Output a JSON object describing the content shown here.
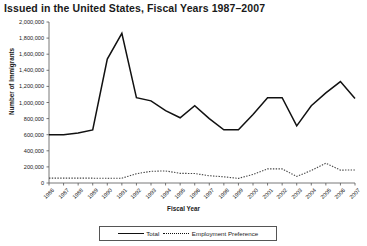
{
  "chart_data": {
    "type": "line",
    "title": "Issued in the United States, Fiscal Years 1987–2007",
    "xlabel": "Fiscal Year",
    "ylabel": "Number of Immigrants",
    "grid": false,
    "legend_position": "bottom",
    "ylim": [
      0,
      2000000
    ],
    "yticks": [
      0,
      200000,
      400000,
      600000,
      800000,
      1000000,
      1200000,
      1400000,
      1600000,
      1800000,
      2000000
    ],
    "ytick_labels": [
      "0",
      "200,000",
      "400,000",
      "600,000",
      "800,000",
      "1,000,000",
      "1,200,000",
      "1,400,000",
      "1,600,000",
      "1,800,000",
      "2,000,000"
    ],
    "categories": [
      "1986",
      "1987",
      "1988",
      "1989",
      "1990",
      "1991",
      "1992",
      "1993",
      "1994",
      "1995",
      "1996",
      "1997",
      "1998",
      "1999",
      "2000",
      "2001",
      "2002",
      "2003",
      "2004",
      "2005",
      "2006",
      "2007"
    ],
    "series": [
      {
        "name": "Total",
        "style": "solid",
        "color": "#111111",
        "values": [
          600000,
          600000,
          620000,
          660000,
          1540000,
          1860000,
          1060000,
          1020000,
          900000,
          810000,
          960000,
          800000,
          660000,
          660000,
          850000,
          1060000,
          1060000,
          710000,
          960000,
          1120000,
          1260000,
          1050000
        ]
      },
      {
        "name": "Employment Preference",
        "style": "dotted",
        "color": "#444444",
        "values": [
          60000,
          60000,
          60000,
          60000,
          58000,
          60000,
          115000,
          145000,
          150000,
          120000,
          118000,
          90000,
          77000,
          57000,
          107000,
          175000,
          175000,
          82000,
          155000,
          246000,
          160000,
          162000
        ]
      }
    ]
  },
  "legend": {
    "total_label": "Total",
    "employment_label": "Employment Preference"
  }
}
